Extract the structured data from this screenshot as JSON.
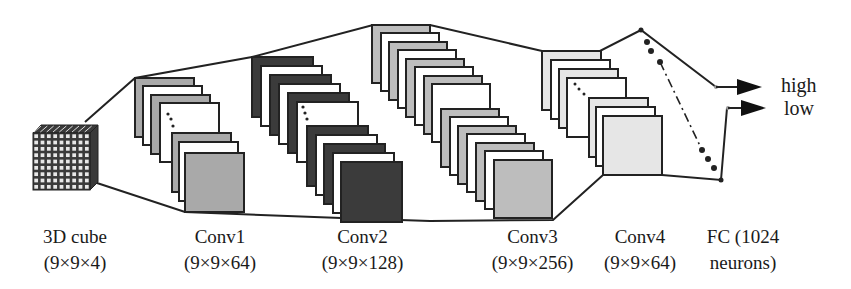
{
  "colors": {
    "line": "#222222",
    "cube_dark": "#3a3a3a",
    "cube_cell": "#e8e8e8",
    "conv1_fill": "#a9a9a9",
    "conv2_fill": "#3b3b3b",
    "conv3_fill": "#bdbdbd",
    "conv4_fill": "#e6e6e6",
    "white_sheet": "#ffffff"
  },
  "layers": [
    {
      "id": "input",
      "name": "3D cube",
      "shape": "(9×9×4)"
    },
    {
      "id": "conv1",
      "name": "Conv1",
      "shape": "(9×9×64)"
    },
    {
      "id": "conv2",
      "name": "Conv2",
      "shape": "(9×9×128)"
    },
    {
      "id": "conv3",
      "name": "Conv3",
      "shape": "(9×9×256)"
    },
    {
      "id": "conv4",
      "name": "Conv4",
      "shape": "(9×9×64)"
    },
    {
      "id": "fc",
      "name": "FC (1024",
      "shape": "neurons)"
    }
  ],
  "outputs": [
    {
      "label": "high"
    },
    {
      "label": "low"
    }
  ]
}
